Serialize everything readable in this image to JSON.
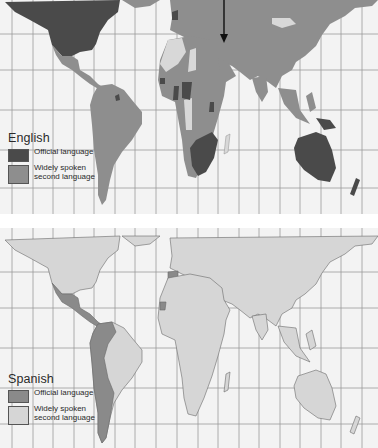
{
  "maps": [
    {
      "id": "english",
      "title": "English",
      "legend": [
        {
          "label": "Official language",
          "color": "#4a4a4a"
        },
        {
          "label": "Widely spoken second language",
          "label_line1": "Widely spoken",
          "label_line2": "second language",
          "color": "#8e8e8e"
        }
      ],
      "annotation": "arrow-pointing-down-at-middle-east"
    },
    {
      "id": "spanish",
      "title": "Spanish",
      "legend": [
        {
          "label": "Official language",
          "color": "#8a8a8a"
        },
        {
          "label": "Widely spoken second language",
          "label_line1": "Widely spoken",
          "label_line2": "second language",
          "color": "#d6d6d6"
        }
      ]
    }
  ],
  "colors": {
    "ocean": "#f3f3f3",
    "grid": "#9a9a9a",
    "english_official": "#4a4a4a",
    "english_second": "#8e8e8e",
    "english_other": "#d8d8d8",
    "spanish_official": "#8a8a8a",
    "spanish_second": "#d6d6d6",
    "border": "#6a6a6a"
  }
}
